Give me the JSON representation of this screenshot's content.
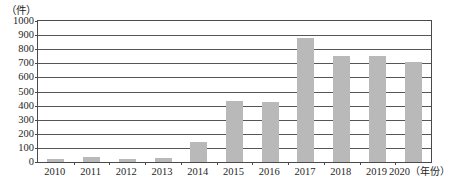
{
  "chart_data": {
    "type": "bar",
    "title": "",
    "xlabel": "年份",
    "ylabel": "",
    "y_unit_label": "（件）",
    "x_unit_label": "（年份）",
    "categories": [
      "2010",
      "2011",
      "2012",
      "2013",
      "2014",
      "2015",
      "2016",
      "2017",
      "2018",
      "2019",
      "2020"
    ],
    "values": [
      20,
      35,
      20,
      30,
      145,
      430,
      425,
      880,
      750,
      750,
      710
    ],
    "ylim": [
      0,
      1000
    ],
    "y_ticks": [
      0,
      100,
      200,
      300,
      400,
      500,
      600,
      700,
      800,
      900,
      1000
    ],
    "y_tick_labels": [
      "0",
      "100",
      "200",
      "300",
      "400",
      "500",
      "600",
      "700",
      "800",
      "900",
      "1000"
    ],
    "grid": true,
    "legend": false,
    "bar_color": "#b9b9b9",
    "axis_color": "#4a4a4a",
    "gridline_color": "#565656"
  }
}
